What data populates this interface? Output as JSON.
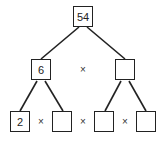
{
  "root": {
    "value": "54"
  },
  "level1": [
    {
      "value": "6"
    },
    {
      "value": ""
    }
  ],
  "level2": [
    {
      "value": "2"
    },
    {
      "value": ""
    },
    {
      "value": ""
    },
    {
      "value": ""
    }
  ],
  "operator": "×",
  "colors": {
    "line": "#222222",
    "background": "#ffffff"
  }
}
